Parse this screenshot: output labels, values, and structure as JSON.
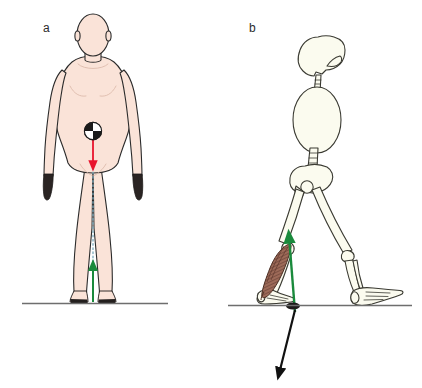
{
  "figure": {
    "width": 422,
    "height": 388,
    "background": "#ffffff",
    "cropped_header_text": "",
    "panels": [
      {
        "id": "a",
        "label": "a",
        "label_x": 43,
        "label_y": 22,
        "view": "anterior view of standing human body",
        "description": "Front-view human figure standing upright with a center-of-mass marker at the pelvis, a red downward body-weight vector, a dotted vertical line of gravity, and a green upward ground reaction force arrow at the feet.",
        "annotations": [
          {
            "name": "center-of-mass-marker",
            "symbol": "com-quadrant-circle",
            "x": 93,
            "y": 133,
            "radius": 9,
            "fill_dark": "#1a1a1a",
            "fill_light": "#ffffff"
          },
          {
            "name": "body-weight-vector",
            "color": "#e8142d",
            "direction": "down",
            "x": 93,
            "y_start": 140,
            "y_end": 168
          },
          {
            "name": "line-of-gravity",
            "color": "#7aa9bb",
            "style": "dotted",
            "x": 93,
            "y_start": 168,
            "y_end": 302
          },
          {
            "name": "ground-reaction-force-vector",
            "color": "#1a8a3c",
            "direction": "up",
            "x": 93,
            "y_start": 302,
            "y_end": 263
          },
          {
            "name": "ground-line",
            "color": "#6e6e6e",
            "x_start": 22,
            "x_end": 168,
            "y": 303
          }
        ]
      },
      {
        "id": "b",
        "label": "b",
        "label_x": 249,
        "label_y": 22,
        "view": "lateral view of walking skeleton",
        "description": "Side-view skeleton in push-off stance showing skull, cervical spine, ribcage, lumbar spine, pelvis, both legs, an active gastrocnemius calf muscle on the trailing leg, a green upward muscle-force arrow and a black downward-sloping ground reaction force arrow.",
        "annotations": [
          {
            "name": "calf-muscle",
            "muscle": "gastrocnemius",
            "fill": "#9d6a58",
            "stroke": "#4a2d22"
          },
          {
            "name": "muscle-force-vector",
            "color": "#1a8a3c",
            "direction": "up",
            "x_start": 295,
            "y_start": 312,
            "x_end": 289,
            "y_end": 232
          },
          {
            "name": "ground-reaction-force-vector",
            "color": "#111111",
            "direction": "down",
            "x_start": 295,
            "y_start": 310,
            "x_end": 279,
            "y_end": 378
          },
          {
            "name": "ground-line",
            "color": "#6e6e6e",
            "x_start": 228,
            "x_end": 412,
            "y": 305
          }
        ]
      }
    ]
  },
  "palette": {
    "skin": "#fae3d8",
    "skin_shadow": "#f2d2c4",
    "outline": "#2b2b2b",
    "bone_fill": "#fbfbef",
    "bone_outline": "#3a3a32",
    "muscle": "#9d6a58",
    "muscle_outline": "#4a2d22",
    "red_vector": "#e8142d",
    "green_vector": "#1a8a3c",
    "black_vector": "#111111",
    "ground_line": "#6e6e6e",
    "gravity_line": "#7aa9bb",
    "label_text": "#2b2b2b"
  }
}
